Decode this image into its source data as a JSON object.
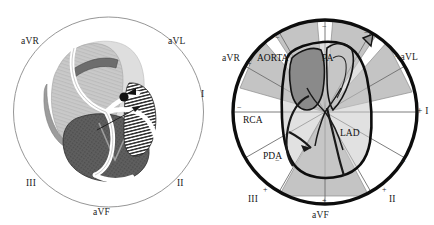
{
  "figure": {
    "background_color": "#ffffff",
    "width": 434,
    "height": 225
  },
  "panels": [
    {
      "id": "left",
      "name": "heart-anatomy-panel",
      "description": "Shaded cross-section of the heart inside a thin reference circle annotated with limb-lead directions",
      "circle": {
        "stroke": "#8a8a8a",
        "stroke_width": 0.8,
        "fill": "none"
      },
      "lead_labels": [
        {
          "text": "aVR",
          "position": "upper-left"
        },
        {
          "text": "aVL",
          "position": "upper-right"
        },
        {
          "text": "I",
          "position": "right"
        },
        {
          "text": "II",
          "position": "lower-right"
        },
        {
          "text": "III",
          "position": "lower-left"
        },
        {
          "text": "aVF",
          "position": "bottom"
        }
      ],
      "colors": {
        "light_myocardium": "#cfcfcf",
        "pale_chamber": "#dcdcdc",
        "dark_myocardium": "#5a5a5a",
        "mid_gray": "#9a9a9a",
        "vessel_white": "#ffffff",
        "outline": "#3a3a3a",
        "hatch_line": "#2e2e2e"
      }
    },
    {
      "id": "right",
      "name": "hexaxial-reference-panel",
      "description": "Thick reference circle with shaded lead-axis wedges, limb-lead axes and labelled coronary arteries over a heart outline",
      "circle": {
        "stroke": "#0d0d0d",
        "stroke_width": 3.2,
        "fill": "none"
      },
      "lead_labels": [
        {
          "text": "aVR",
          "sign": "+",
          "position": "upper-left"
        },
        {
          "text": "+aVL",
          "sign": "",
          "position": "upper-right"
        },
        {
          "text": "+ I",
          "sign": "",
          "position": "right"
        },
        {
          "text": "II",
          "sign": "+",
          "position": "lower-right"
        },
        {
          "text": "III",
          "sign": "+",
          "position": "lower-left"
        },
        {
          "text": "aVF",
          "sign": "+",
          "position": "bottom"
        }
      ],
      "polarity_marks": {
        "plus": "+",
        "minus": "−"
      },
      "vessel_labels": [
        {
          "text": "AORTA",
          "name": "aorta"
        },
        {
          "text": "PA",
          "name": "pulmonary-artery"
        },
        {
          "text": "RCA",
          "name": "right-coronary-artery"
        },
        {
          "text": "LAD",
          "name": "left-anterior-descending-artery"
        },
        {
          "text": "PDA",
          "name": "posterior-descending-artery"
        }
      ],
      "colors": {
        "wedge_fill": "#c0c0c0",
        "wedge_stroke": "#8c8c8c",
        "aorta_fill": "#8c8c8c",
        "heart_fill": "#c9c9c9",
        "heart_outline": "#0d0d0d",
        "axis_line": "#6e6e6e",
        "circle": "#0d0d0d"
      }
    }
  ]
}
